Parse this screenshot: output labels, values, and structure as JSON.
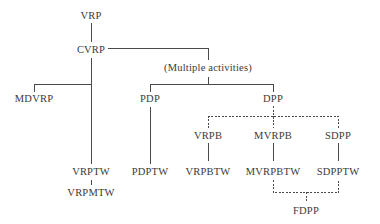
{
  "diagram": {
    "type": "taxonomy-tree",
    "nodes": {
      "vrp": {
        "label": "VRP",
        "x": 91,
        "y": 16
      },
      "cvrp": {
        "label": "CVRP",
        "x": 91,
        "y": 50
      },
      "multiple": {
        "label": "(Multiple activities)",
        "x": 208,
        "y": 68
      },
      "mdvrp": {
        "label": "MDVRP",
        "x": 34,
        "y": 99
      },
      "pdp": {
        "label": "PDP",
        "x": 150,
        "y": 99
      },
      "dpp": {
        "label": "DPP",
        "x": 273,
        "y": 99
      },
      "vrpb": {
        "label": "VRPB",
        "x": 208,
        "y": 136
      },
      "mvrpb": {
        "label": "MVRPB",
        "x": 273,
        "y": 136
      },
      "sdpp": {
        "label": "SDPP",
        "x": 338,
        "y": 136
      },
      "vrptw": {
        "label": "VRPTW",
        "x": 91,
        "y": 172
      },
      "pdptw": {
        "label": "PDPTW",
        "x": 150,
        "y": 172
      },
      "vrpbtw": {
        "label": "VRPBTW",
        "x": 208,
        "y": 172
      },
      "mvrpbtw": {
        "label": "MVRPBTW",
        "x": 273,
        "y": 172
      },
      "sdpptw": {
        "label": "SDPPTW",
        "x": 338,
        "y": 172
      },
      "vrpmtw": {
        "label": "VRPMTW",
        "x": 91,
        "y": 193
      },
      "fdpp": {
        "label": "FDPP",
        "x": 306,
        "y": 211
      }
    },
    "edges": [
      {
        "from": "VRP",
        "to": "CVRP",
        "style": "solid"
      },
      {
        "from": "CVRP",
        "to": "(Multiple activities)",
        "style": "solid"
      },
      {
        "from": "CVRP",
        "to": "MDVRP",
        "style": "solid"
      },
      {
        "from": "CVRP",
        "to": "VRPTW",
        "style": "solid"
      },
      {
        "from": "VRPTW",
        "to": "VRPMTW",
        "style": "solid"
      },
      {
        "from": "(Multiple activities)",
        "to": "PDP",
        "style": "solid"
      },
      {
        "from": "(Multiple activities)",
        "to": "DPP",
        "style": "solid"
      },
      {
        "from": "PDP",
        "to": "PDPTW",
        "style": "solid"
      },
      {
        "from": "DPP",
        "to": "VRPB",
        "style": "dashed"
      },
      {
        "from": "DPP",
        "to": "MVRPB",
        "style": "dashed"
      },
      {
        "from": "DPP",
        "to": "SDPP",
        "style": "dashed"
      },
      {
        "from": "VRPB",
        "to": "VRPBTW",
        "style": "solid"
      },
      {
        "from": "MVRPB",
        "to": "MVRPBTW",
        "style": "solid"
      },
      {
        "from": "SDPP",
        "to": "SDPPTW",
        "style": "solid"
      },
      {
        "from": "MVRPBTW",
        "to": "FDPP",
        "style": "dashed"
      },
      {
        "from": "SDPPTW",
        "to": "FDPP",
        "style": "dashed"
      }
    ],
    "colors": {
      "line": "#4a4a4a",
      "text": "#3a3a3a",
      "background": "#ffffff"
    }
  }
}
